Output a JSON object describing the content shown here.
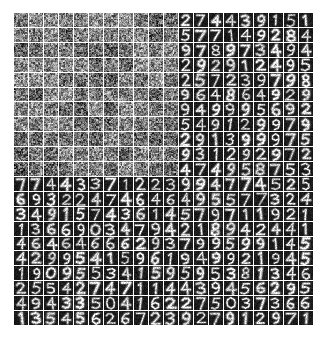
{
  "figure": {
    "kind": "image-grid",
    "background_color": "#ffffff",
    "separator_color": "#ffffff",
    "tile_background_color": "#0d0d0d",
    "noise_mean_color": "#8a8a8a",
    "stroke_color": "#f2f2f2",
    "grid": {
      "columns": 20,
      "rows": 21,
      "cell_width_px": 14,
      "cell_height_px": 14,
      "gap_px": 1,
      "left_px": 14,
      "top_px": 13
    },
    "transition": {
      "note": "L-shaped boundary: tiles left of column 11 and above row 12 are noise; all others are digits",
      "noise_column_limit": 11,
      "noise_row_limit": 11
    }
  },
  "chart_data": {
    "type": "heatmap",
    "title": "",
    "xlabel": "",
    "ylabel": "",
    "tiles": [
      [
        "noise",
        "noise",
        "noise",
        "noise",
        "noise",
        "noise",
        "noise",
        "noise",
        "noise",
        "noise",
        "noise",
        "2",
        "7",
        "4",
        "4",
        "3",
        "9",
        "1",
        "5",
        "1"
      ],
      [
        "noise",
        "noise",
        "noise",
        "noise",
        "noise",
        "noise",
        "noise",
        "noise",
        "noise",
        "noise",
        "noise",
        "5",
        "7",
        "7",
        "1",
        "4",
        "9",
        "2",
        "8",
        "4"
      ],
      [
        "noise",
        "noise",
        "noise",
        "noise",
        "noise",
        "noise",
        "noise",
        "noise",
        "noise",
        "noise",
        "noise",
        "9",
        "7",
        "8",
        "9",
        "7",
        "3",
        "4",
        "9",
        "4"
      ],
      [
        "noise",
        "noise",
        "noise",
        "noise",
        "noise",
        "noise",
        "noise",
        "noise",
        "noise",
        "noise",
        "noise",
        "2",
        "9",
        "2",
        "9",
        "1",
        "2",
        "4",
        "9",
        "5"
      ],
      [
        "noise",
        "noise",
        "noise",
        "noise",
        "noise",
        "noise",
        "noise",
        "noise",
        "noise",
        "noise",
        "noise",
        "2",
        "5",
        "7",
        "2",
        "3",
        "9",
        "7",
        "9",
        "8"
      ],
      [
        "noise",
        "noise",
        "noise",
        "noise",
        "noise",
        "noise",
        "noise",
        "noise",
        "noise",
        "noise",
        "noise",
        "9",
        "6",
        "4",
        "8",
        "6",
        "4",
        "9",
        "2",
        "9"
      ],
      [
        "noise",
        "noise",
        "noise",
        "noise",
        "noise",
        "noise",
        "noise",
        "noise",
        "noise",
        "noise",
        "noise",
        "9",
        "4",
        "9",
        "9",
        "9",
        "5",
        "6",
        "9",
        "2"
      ],
      [
        "noise",
        "noise",
        "noise",
        "noise",
        "noise",
        "noise",
        "noise",
        "noise",
        "noise",
        "noise",
        "noise",
        "5",
        "4",
        "9",
        "1",
        "2",
        "9",
        "9",
        "7",
        "9"
      ],
      [
        "noise",
        "noise",
        "noise",
        "noise",
        "noise",
        "noise",
        "noise",
        "noise",
        "noise",
        "noise",
        "noise",
        "2",
        "9",
        "1",
        "3",
        "9",
        "9",
        "9",
        "7",
        "5"
      ],
      [
        "noise",
        "noise",
        "noise",
        "noise",
        "noise",
        "noise",
        "noise",
        "noise",
        "noise",
        "noise",
        "noise",
        "9",
        "3",
        "1",
        "2",
        "9",
        "2",
        "9",
        "7",
        "2"
      ],
      [
        "noise",
        "noise",
        "noise",
        "noise",
        "noise",
        "noise",
        "noise",
        "noise",
        "noise",
        "noise",
        "noise",
        "4",
        "7",
        "4",
        "9",
        "5",
        "8",
        "7",
        "5",
        "3"
      ],
      [
        "7",
        "7",
        "4",
        "4",
        "3",
        "3",
        "7",
        "1",
        "2",
        "2",
        "3",
        "9",
        "9",
        "4",
        "7",
        "7",
        "4",
        "5",
        "2",
        "5"
      ],
      [
        "6",
        "9",
        "3",
        "2",
        "2",
        "4",
        "7",
        "4",
        "6",
        "4",
        "6",
        "4",
        "9",
        "5",
        "5",
        "7",
        "7",
        "3",
        "2",
        "4"
      ],
      [
        "3",
        "4",
        "9",
        "1",
        "5",
        "7",
        "4",
        "3",
        "6",
        "1",
        "4",
        "5",
        "7",
        "9",
        "7",
        "1",
        "1",
        "9",
        "2",
        "1"
      ],
      [
        "1",
        "3",
        "6",
        "6",
        "9",
        "0",
        "3",
        "4",
        "7",
        "9",
        "4",
        "2",
        "1",
        "8",
        "9",
        "4",
        "2",
        "4",
        "4",
        "1"
      ],
      [
        "4",
        "6",
        "4",
        "6",
        "4",
        "6",
        "6",
        "6",
        "2",
        "9",
        "3",
        "7",
        "9",
        "9",
        "5",
        "9",
        "9",
        "1",
        "4",
        "5"
      ],
      [
        "4",
        "2",
        "9",
        "9",
        "5",
        "4",
        "1",
        "5",
        "9",
        "6",
        "1",
        "9",
        "4",
        "9",
        "9",
        "2",
        "1",
        "9",
        "4",
        "5"
      ],
      [
        "1",
        "9",
        "0",
        "9",
        "5",
        "5",
        "3",
        "4",
        "1",
        "5",
        "9",
        "5",
        "9",
        "5",
        "3",
        "8",
        "1",
        "3",
        "4",
        "6"
      ],
      [
        "2",
        "5",
        "5",
        "4",
        "2",
        "7",
        "4",
        "7",
        "1",
        "1",
        "4",
        "4",
        "3",
        "9",
        "4",
        "5",
        "6",
        "2",
        "9",
        "5"
      ],
      [
        "4",
        "9",
        "4",
        "3",
        "3",
        "5",
        "0",
        "4",
        "1",
        "6",
        "2",
        "2",
        "7",
        "5",
        "0",
        "3",
        "7",
        "3",
        "6",
        "6"
      ],
      [
        "1",
        "3",
        "5",
        "4",
        "5",
        "6",
        "2",
        "6",
        "7",
        "2",
        "3",
        "9",
        "2",
        "7",
        "9",
        "1",
        "2",
        "9",
        "7",
        "1"
      ]
    ],
    "rows": 21,
    "columns": 20,
    "legend": [],
    "grid_on": false
  }
}
